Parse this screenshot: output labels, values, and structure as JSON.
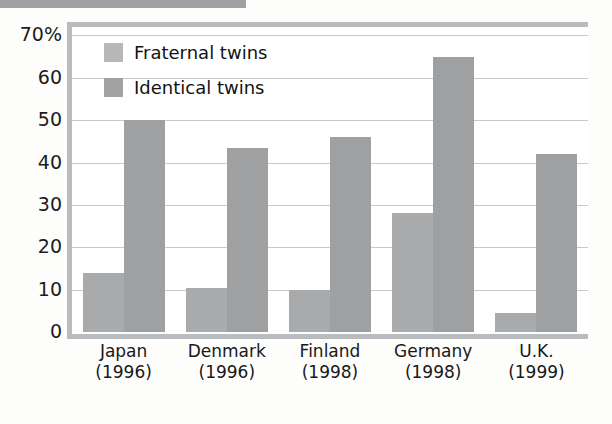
{
  "chart_data": {
    "type": "bar",
    "title": "",
    "xlabel": "",
    "ylabel": "",
    "ylim": [
      0,
      72
    ],
    "yticks": [
      0,
      10,
      20,
      30,
      40,
      50,
      60,
      70
    ],
    "ytick_labels": [
      "0",
      "10",
      "20",
      "30",
      "40",
      "50",
      "60",
      "70%"
    ],
    "grid": true,
    "legend_position": "top-left",
    "categories": [
      "Japan",
      "Denmark",
      "Finland",
      "Germany",
      "U.K."
    ],
    "category_years": [
      "(1996)",
      "(1996)",
      "(1998)",
      "(1998)",
      "(1999)"
    ],
    "series": [
      {
        "name": "Fraternal twins",
        "color": "#a8aaab",
        "values": [
          14,
          10.5,
          10,
          28,
          4.5
        ]
      },
      {
        "name": "Identical twins",
        "color": "#9ea0a1",
        "values": [
          50,
          43.5,
          46,
          65,
          42
        ]
      }
    ]
  },
  "legend": {
    "items": [
      {
        "label": "Fraternal twins",
        "swatch": "fraternal"
      },
      {
        "label": "Identical twins",
        "swatch": "identical"
      }
    ]
  },
  "colors": {
    "frame": "#b9bcbe",
    "gridline": "#c6c9cb",
    "fraternal": "#a8aaab",
    "identical": "#9ea0a1",
    "text": "#1a1a1a",
    "background": "#ffffff"
  }
}
